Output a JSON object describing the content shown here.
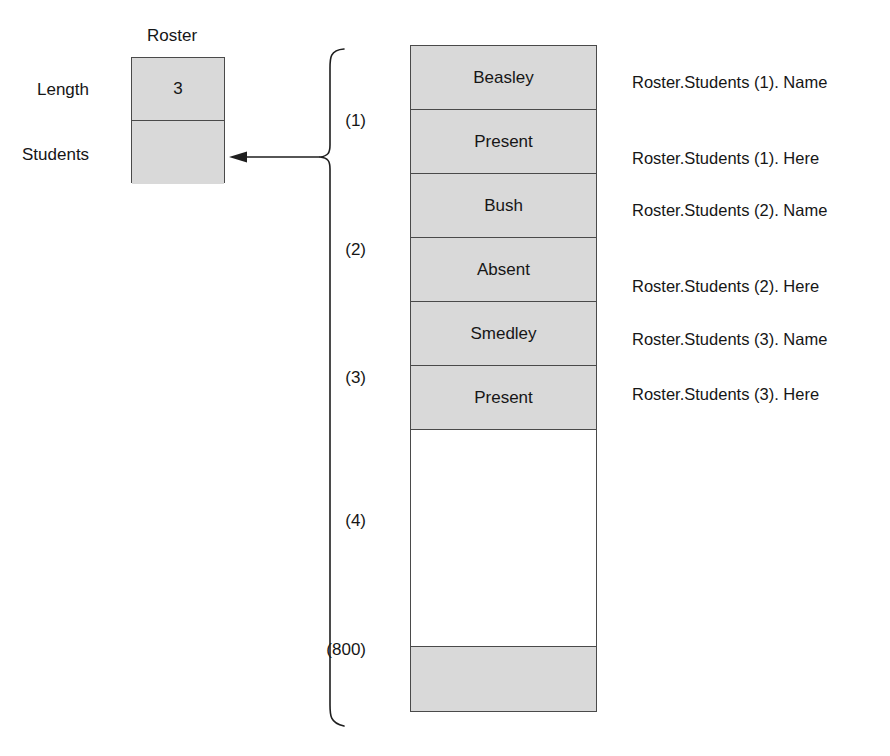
{
  "diagram": {
    "record": {
      "title": "Roster",
      "fields": [
        {
          "label": "Length",
          "value": "3"
        },
        {
          "label": "Students",
          "value": ""
        }
      ]
    },
    "array": {
      "cells": [
        {
          "text": "Beasley",
          "state": "filled"
        },
        {
          "text": "Present",
          "state": "filled"
        },
        {
          "text": "Bush",
          "state": "filled"
        },
        {
          "text": "Absent",
          "state": "filled"
        },
        {
          "text": "Smedley",
          "state": "filled"
        },
        {
          "text": "Present",
          "state": "filled"
        },
        {
          "text": "",
          "state": "empty"
        },
        {
          "text": "",
          "state": "tail"
        }
      ],
      "index_labels": [
        "(1)",
        "(2)",
        "(3)",
        "(4)",
        "(800)"
      ],
      "ellipsis_dot_count": 7
    },
    "path_labels": [
      "Roster.Students (1). Name",
      "Roster.Students (1). Here",
      "Roster.Students (2). Name",
      "Roster.Students (2). Here",
      "Roster.Students (3). Name",
      "Roster.Students (3). Here"
    ],
    "colors": {
      "cell_fill": "#d9d9d9",
      "empty_fill": "#ffffff",
      "stroke": "#4a4a4a",
      "text": "#161616",
      "dot": "#101010",
      "background": "#ffffff"
    }
  }
}
